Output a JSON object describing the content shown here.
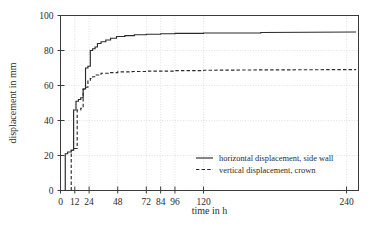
{
  "chart_data": {
    "type": "line",
    "title": "",
    "xlabel": "time in h",
    "ylabel": "displacement in mm",
    "xlim": [
      0,
      250
    ],
    "ylim": [
      0,
      100
    ],
    "grid": true,
    "legend_position": "inside lower right",
    "xticks": [
      0,
      12,
      24,
      48,
      72,
      84,
      96,
      120,
      240
    ],
    "xticklabels": [
      "0",
      "12",
      "24",
      "48",
      "72",
      "84",
      "96",
      "120",
      "240"
    ],
    "yticks": [
      0,
      20,
      40,
      60,
      80,
      100
    ],
    "yticklabels": [
      "0",
      "20",
      "40",
      "60",
      "80",
      "100"
    ],
    "series": [
      {
        "name": "horizontal displacement, side wall",
        "style": "solid",
        "color": "#2a2a2a",
        "x": [
          4,
          4,
          6,
          6,
          9,
          9,
          11,
          11,
          13,
          13,
          15,
          15,
          17,
          17,
          19,
          19,
          21,
          21,
          23,
          23,
          25,
          25,
          27,
          27,
          29,
          29,
          31,
          31,
          34,
          34,
          38,
          38,
          42,
          42,
          47,
          47,
          54,
          54,
          62,
          62,
          72,
          72,
          84,
          84,
          96,
          96,
          120,
          120,
          168,
          168,
          248
        ],
        "y": [
          0,
          21,
          21,
          22,
          22,
          23,
          23,
          46,
          46,
          51,
          51,
          52,
          52,
          53,
          53,
          58,
          58,
          70,
          70,
          71,
          71,
          80,
          80,
          81,
          81,
          82,
          82,
          84,
          84,
          85,
          85,
          86,
          86,
          87,
          87,
          88,
          88,
          88.5,
          88.5,
          89,
          89,
          89.3,
          89.3,
          89.6,
          89.6,
          89.8,
          89.8,
          90,
          90,
          90.3,
          90.6
        ]
      },
      {
        "name": "vertical displacement, crown",
        "style": "dashed",
        "color": "#2a2a2a",
        "x": [
          9,
          9,
          11,
          11,
          14,
          14,
          17,
          17,
          19,
          19,
          21,
          21,
          23,
          23,
          25,
          25,
          27,
          27,
          30,
          30,
          34,
          34,
          40,
          40,
          48,
          48,
          60,
          60,
          72,
          72,
          96,
          96,
          120,
          120,
          168,
          248
        ],
        "y": [
          0,
          23,
          23,
          24,
          24,
          46,
          46,
          47,
          47,
          58,
          58,
          59,
          59,
          63,
          63,
          64,
          64,
          65,
          65,
          66,
          66,
          67,
          67,
          67.4,
          67.4,
          67.8,
          67.8,
          68,
          68,
          68.2,
          68.2,
          68.5,
          68.5,
          68.7,
          68.9,
          69.1
        ]
      }
    ],
    "legend": [
      {
        "label": "horizontal displacement, side wall",
        "style": "solid"
      },
      {
        "label": "vertical displacement, crown",
        "style": "dashed"
      }
    ]
  }
}
